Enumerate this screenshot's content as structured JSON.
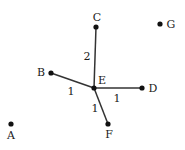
{
  "diagram": {
    "type": "weighted-graph",
    "colors": {
      "node": "#111111",
      "edge": "#333333",
      "text": "#1a1a1a",
      "background": "#ffffff"
    },
    "nodes": [
      {
        "id": "A",
        "label": "A",
        "x": 11,
        "y": 124,
        "lx": 11,
        "ly": 139
      },
      {
        "id": "B",
        "label": "B",
        "x": 51,
        "y": 73,
        "lx": 41,
        "ly": 76
      },
      {
        "id": "C",
        "label": "C",
        "x": 96,
        "y": 27,
        "lx": 97,
        "ly": 21
      },
      {
        "id": "D",
        "label": "D",
        "x": 142,
        "y": 88,
        "lx": 153,
        "ly": 92
      },
      {
        "id": "E",
        "label": "E",
        "x": 94,
        "y": 88,
        "lx": 102,
        "ly": 84
      },
      {
        "id": "F",
        "label": "F",
        "x": 108,
        "y": 124,
        "lx": 109,
        "ly": 138
      },
      {
        "id": "G",
        "label": "G",
        "x": 160,
        "y": 24,
        "lx": 171,
        "ly": 28
      }
    ],
    "edges": [
      {
        "from": "E",
        "to": "C",
        "weight": "2",
        "wx": 87,
        "wy": 60
      },
      {
        "from": "E",
        "to": "B",
        "weight": "1",
        "wx": 71,
        "wy": 95
      },
      {
        "from": "E",
        "to": "D",
        "weight": "1",
        "wx": 117,
        "wy": 102
      },
      {
        "from": "E",
        "to": "F",
        "weight": "1",
        "wx": 95,
        "wy": 112
      }
    ]
  }
}
